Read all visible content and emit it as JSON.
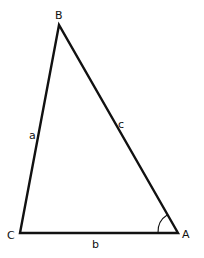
{
  "diagram": {
    "type": "triangle",
    "vertices": {
      "A": {
        "label": "A",
        "x": 178,
        "y": 233
      },
      "B": {
        "label": "B",
        "x": 59,
        "y": 25
      },
      "C": {
        "label": "C",
        "x": 20,
        "y": 233
      }
    },
    "sides": {
      "a": {
        "label": "a",
        "between": [
          "B",
          "C"
        ]
      },
      "b": {
        "label": "b",
        "between": [
          "C",
          "A"
        ]
      },
      "c": {
        "label": "c",
        "between": [
          "A",
          "B"
        ]
      }
    },
    "marked_angle": "A",
    "colors": {
      "stroke": "#111111",
      "background": "#ffffff"
    }
  }
}
